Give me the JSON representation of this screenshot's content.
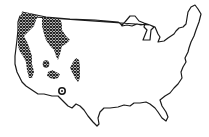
{
  "map": {
    "subject": "Contiguous United States outline",
    "style": "black-and-white line drawing",
    "legend": null,
    "colors": {
      "outline": "#1a1a1a",
      "hatch": "#1a1a1a",
      "background": "#ffffff"
    },
    "shaded_regions": [
      {
        "id": "pacific-northwest-coast",
        "description": "Coastal Washington / Oregon / northern California"
      },
      {
        "id": "northern-rockies",
        "description": "Northern Idaho / western Montana"
      },
      {
        "id": "sierra-nevada",
        "description": "Eastern California strip"
      },
      {
        "id": "nevada-spot",
        "description": "Small isolated spot, central Nevada"
      },
      {
        "id": "utah-patch",
        "description": "Small patch, southern Utah / northern Arizona"
      },
      {
        "id": "colorado-rockies",
        "description": "Central Colorado band"
      },
      {
        "id": "arizona-spot",
        "description": "Small isolated spot, central Arizona"
      }
    ]
  }
}
